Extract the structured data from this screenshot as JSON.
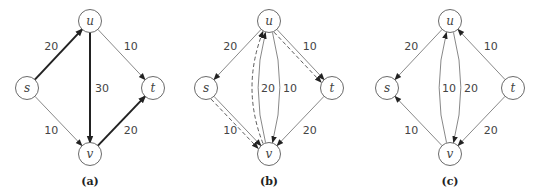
{
  "nodes": [
    "s",
    "u",
    "t",
    "v"
  ],
  "panels": [
    {
      "caption": "(a)",
      "edges": [
        {
          "from": "s",
          "to": "u",
          "label": "20",
          "style": "thick"
        },
        {
          "from": "u",
          "to": "v",
          "label": "30",
          "style": "thick"
        },
        {
          "from": "v",
          "to": "t",
          "label": "20",
          "style": "thick"
        },
        {
          "from": "u",
          "to": "t",
          "label": "10",
          "style": "thin"
        },
        {
          "from": "s",
          "to": "v",
          "label": "10",
          "style": "thin"
        }
      ]
    },
    {
      "caption": "(b)",
      "edges": [
        {
          "from": "u",
          "to": "s",
          "label": "20",
          "style": "thin"
        },
        {
          "from": "u",
          "to": "t",
          "label": "10",
          "style": "thin"
        },
        {
          "from": "u",
          "to": "t",
          "label": "",
          "style": "dashed"
        },
        {
          "from": "s",
          "to": "v",
          "label": "10",
          "style": "thin"
        },
        {
          "from": "s",
          "to": "v",
          "label": "",
          "style": "dashed"
        },
        {
          "from": "t",
          "to": "v",
          "label": "20",
          "style": "thin"
        },
        {
          "from": "v",
          "to": "u",
          "label": "20",
          "style": "thin",
          "curve": "left"
        },
        {
          "from": "u",
          "to": "v",
          "label": "10",
          "style": "thin",
          "curve": "right"
        },
        {
          "from": "v",
          "to": "u",
          "label": "",
          "style": "dashed",
          "curve": "farleft"
        }
      ]
    },
    {
      "caption": "(c)",
      "edges": [
        {
          "from": "u",
          "to": "s",
          "label": "20",
          "style": "thin"
        },
        {
          "from": "t",
          "to": "u",
          "label": "10",
          "style": "thin"
        },
        {
          "from": "v",
          "to": "s",
          "label": "10",
          "style": "thin"
        },
        {
          "from": "t",
          "to": "v",
          "label": "20",
          "style": "thin"
        },
        {
          "from": "v",
          "to": "u",
          "label": "10",
          "style": "thin",
          "curve": "left"
        },
        {
          "from": "u",
          "to": "v",
          "label": "20",
          "style": "thin",
          "curve": "right"
        }
      ]
    }
  ]
}
